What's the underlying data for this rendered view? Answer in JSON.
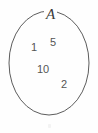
{
  "figure": {
    "kind": "set-venn-diagram",
    "background_color": "#fefefe",
    "stroke_color": "#4a4a4a",
    "text_color": "#555555",
    "label_color": "#3a3a3a",
    "width": 98,
    "height": 133
  },
  "set": {
    "label": "A",
    "shape": "ellipse",
    "center_x": 49,
    "center_y": 63,
    "radius_x": 40,
    "radius_y": 52
  },
  "elements": [
    {
      "value": "1",
      "x": 31,
      "y": 42
    },
    {
      "value": "5",
      "x": 50,
      "y": 37
    },
    {
      "value": "10",
      "x": 37,
      "y": 64
    },
    {
      "value": "2",
      "x": 61,
      "y": 79
    }
  ],
  "artifact": {
    "present": true,
    "x": 48,
    "y": 124,
    "width": 3,
    "height": 4
  }
}
